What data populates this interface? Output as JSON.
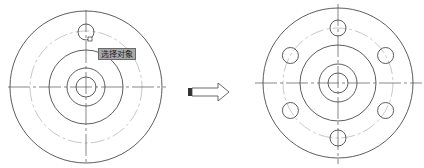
{
  "figure": {
    "left_drawing": {
      "label": "before",
      "center": [
        86,
        87
      ],
      "outer_circle_r": 76,
      "bolt_circle_r": 56,
      "middle_circle_r": 37,
      "inner_circle_r": 19,
      "bore_circle_r": 10,
      "hole": {
        "cx": 86,
        "cy": 32,
        "r": 8
      },
      "tooltip": "选择对象"
    },
    "arrow": {
      "direction": "right"
    },
    "right_drawing": {
      "label": "after",
      "center": [
        338,
        83
      ],
      "outer_circle_r": 75,
      "bolt_circle_r": 55,
      "middle_circle_r": 38,
      "inner_circle_r": 19,
      "bore_circle_r": 10,
      "hole_count": 6,
      "hole_r": 8
    },
    "colors": {
      "line": "#333333",
      "centerline": "#c8c8c8",
      "tooltip_bg": "#a8a8a8"
    }
  }
}
